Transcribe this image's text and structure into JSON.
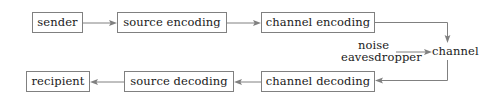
{
  "diagram": {
    "type": "flowchart",
    "background_color": "#ffffff",
    "line_color": "#808080",
    "text_color": "#1a1a1a",
    "nodes": [
      {
        "id": "sender",
        "label": "sender",
        "row": "top",
        "shape": "rect"
      },
      {
        "id": "source-encoding",
        "label": "source encoding",
        "row": "top",
        "shape": "rect"
      },
      {
        "id": "channel-encoding",
        "label": "channel encoding",
        "row": "top",
        "shape": "rect"
      },
      {
        "id": "channel-decoding",
        "label": "channel decoding",
        "row": "bottom",
        "shape": "rect"
      },
      {
        "id": "source-decoding",
        "label": "source decoding",
        "row": "bottom",
        "shape": "rect"
      },
      {
        "id": "recipient",
        "label": "recipient",
        "row": "bottom",
        "shape": "rect"
      }
    ],
    "labels": [
      {
        "id": "noise",
        "text": "noise"
      },
      {
        "id": "eavesdropper",
        "text": "eavesdropper"
      },
      {
        "id": "channel",
        "text": "channel"
      }
    ],
    "edges": [
      {
        "id": "sender-to-source-encoding",
        "from": "sender",
        "to": "source-encoding",
        "style": "arrow-right"
      },
      {
        "id": "source-encoding-to-channel-encoding",
        "from": "source-encoding",
        "to": "channel-encoding",
        "style": "arrow-right"
      },
      {
        "id": "channel-encoding-to-channel",
        "from": "channel-encoding",
        "to": "channel",
        "style": "elbow-down"
      },
      {
        "id": "eavesdropper-to-channel",
        "from": "eavesdropper",
        "to": "channel",
        "style": "arrow-right"
      },
      {
        "id": "channel-to-channel-decoding",
        "from": "channel",
        "to": "channel-decoding",
        "style": "elbow-left"
      },
      {
        "id": "channel-decoding-to-source-decoding",
        "from": "channel-decoding",
        "to": "source-decoding",
        "style": "arrow-left"
      },
      {
        "id": "source-decoding-to-recipient",
        "from": "source-decoding",
        "to": "recipient",
        "style": "arrow-left"
      }
    ]
  }
}
